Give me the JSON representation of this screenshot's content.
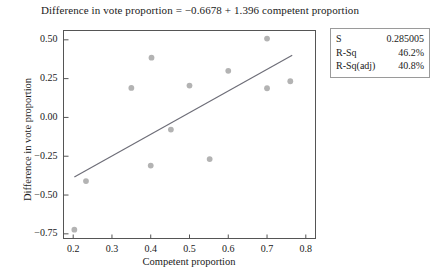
{
  "chart_data": {
    "type": "scatter",
    "title": "Difference in vote proportion = −0.6678 + 1.396 competent proportion",
    "xlabel": "Competent proportion",
    "ylabel": "Difference in vote proportion",
    "xlim": [
      0.175,
      0.825
    ],
    "ylim": [
      -0.78,
      0.56
    ],
    "xticks": [
      0.2,
      0.3,
      0.4,
      0.5,
      0.6,
      0.7,
      0.8
    ],
    "xticklabels": [
      "0.2",
      "0.3",
      "0.4",
      "0.5",
      "0.6",
      "0.7",
      "0.8"
    ],
    "yticks": [
      0.5,
      0.25,
      0.0,
      -0.25,
      -0.5,
      -0.75
    ],
    "yticklabels": [
      "0.50",
      "0.25",
      "0.00",
      "−0.25",
      "−0.50",
      "−0.75"
    ],
    "grid": false,
    "legend": "none",
    "marker_color": "#b3b3b3",
    "line_color": "#6e6e78",
    "axis_color": "#555555",
    "points": [
      {
        "x": 0.203,
        "y": -0.723
      },
      {
        "x": 0.233,
        "y": -0.41
      },
      {
        "x": 0.35,
        "y": 0.19
      },
      {
        "x": 0.402,
        "y": 0.385
      },
      {
        "x": 0.4,
        "y": -0.31
      },
      {
        "x": 0.452,
        "y": -0.078
      },
      {
        "x": 0.5,
        "y": 0.205
      },
      {
        "x": 0.552,
        "y": -0.268
      },
      {
        "x": 0.6,
        "y": 0.3
      },
      {
        "x": 0.7,
        "y": 0.508
      },
      {
        "x": 0.7,
        "y": 0.188
      },
      {
        "x": 0.76,
        "y": 0.233
      }
    ],
    "fit_line": {
      "intercept": -0.6678,
      "slope": 1.396,
      "x_start": 0.203,
      "x_end": 0.765
    }
  },
  "stats_box": {
    "rows": [
      {
        "label": "S",
        "value": "0.285005"
      },
      {
        "label": "R-Sq",
        "value": "46.2%"
      },
      {
        "label": "R-Sq(adj)",
        "value": "40.8%"
      }
    ]
  }
}
